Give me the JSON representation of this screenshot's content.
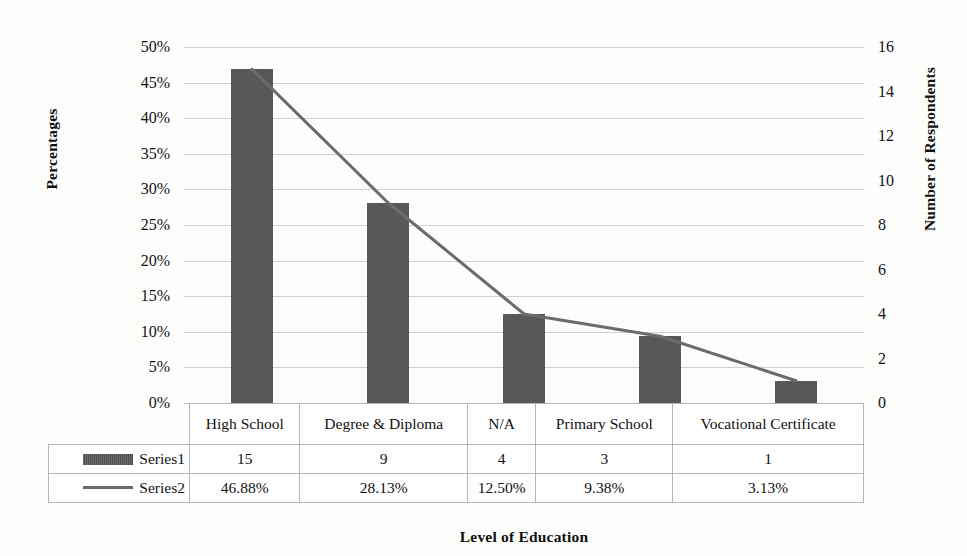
{
  "chart_data": {
    "type": "bar",
    "title": "",
    "categories": [
      "High School",
      "Degree & Diploma",
      "N/A",
      "Primary School",
      "Vocational Certificate"
    ],
    "series": [
      {
        "name": "Series1",
        "axis": "right",
        "kind": "bar",
        "values": [
          15,
          9,
          4,
          3,
          1
        ],
        "display": [
          "15",
          "9",
          "4",
          "3",
          "1"
        ],
        "color": "#585858"
      },
      {
        "name": "Series2",
        "axis": "left",
        "kind": "line",
        "values": [
          46.88,
          28.13,
          12.5,
          9.38,
          3.13
        ],
        "display": [
          "46.88%",
          "28.13%",
          "12.50%",
          "9.38%",
          "3.13%"
        ],
        "color": "#6b6b6b"
      }
    ],
    "xlabel": "Level of Education",
    "ylabel": "Percentages",
    "y2label": "Number of Respondents",
    "ylim": [
      0,
      50
    ],
    "y2lim": [
      0,
      16
    ],
    "yticks": [
      "0%",
      "5%",
      "10%",
      "15%",
      "20%",
      "25%",
      "30%",
      "35%",
      "40%",
      "45%",
      "50%"
    ],
    "y2ticks": [
      "0",
      "2",
      "4",
      "6",
      "8",
      "10",
      "12",
      "14",
      "16"
    ],
    "grid": true,
    "legend_position": "data-table"
  },
  "axes": {
    "left_title": "Percentages",
    "right_title": "Number of Respondents",
    "x_title": "Level of Education",
    "left_ticks": [
      "50%",
      "45%",
      "40%",
      "35%",
      "30%",
      "25%",
      "20%",
      "15%",
      "10%",
      "5%",
      "0%"
    ],
    "right_ticks": [
      "16",
      "14",
      "12",
      "10",
      "8",
      "6",
      "4",
      "2",
      "0"
    ]
  },
  "table": {
    "categories": [
      "High School",
      "Degree & Diploma",
      "N/A",
      "Primary School",
      "Vocational Certificate"
    ],
    "rows": [
      {
        "legend": "Series1",
        "marker": "bar-swatch",
        "values": [
          "15",
          "9",
          "4",
          "3",
          "1"
        ]
      },
      {
        "legend": "Series2",
        "marker": "line-swatch",
        "values": [
          "46.88%",
          "28.13%",
          "12.50%",
          "9.38%",
          "3.13%"
        ]
      }
    ]
  },
  "colors": {
    "bar": "#585858",
    "line": "#6b6b6b",
    "grid": "#c9c9c9",
    "text": "#111111",
    "background": "#fdfdfc"
  }
}
